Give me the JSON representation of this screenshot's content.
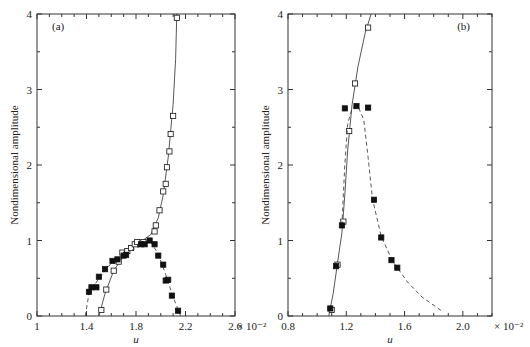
{
  "chart_data": [
    {
      "type": "scatter",
      "panel_label": "(a)",
      "xlabel": "u",
      "ylabel": "Nondimensional amplitude",
      "x_multiplier": "× 10⁻²",
      "xlim": [
        1.0,
        2.6
      ],
      "ylim": [
        0,
        4
      ],
      "xticks": [
        "1",
        "1.4",
        "1.8",
        "2.2",
        "2.6"
      ],
      "yticks": [
        "0",
        "1",
        "2",
        "3",
        "4"
      ],
      "series": [
        {
          "name": "open squares (solid fit)",
          "marker": "open-square",
          "line": "solid",
          "points": [
            [
              1.52,
              0.08
            ],
            [
              1.56,
              0.35
            ],
            [
              1.62,
              0.6
            ],
            [
              1.66,
              0.72
            ],
            [
              1.69,
              0.84
            ],
            [
              1.73,
              0.86
            ],
            [
              1.76,
              0.9
            ],
            [
              1.79,
              0.95
            ],
            [
              1.81,
              0.98
            ],
            [
              1.86,
              0.98
            ],
            [
              1.95,
              1.12
            ],
            [
              1.96,
              1.2
            ],
            [
              1.99,
              1.4
            ],
            [
              2.02,
              1.65
            ],
            [
              2.04,
              1.75
            ],
            [
              2.05,
              1.97
            ],
            [
              2.07,
              2.18
            ],
            [
              2.08,
              2.41
            ],
            [
              2.1,
              2.65
            ],
            [
              2.13,
              3.95
            ]
          ],
          "fit": [
            [
              1.5,
              0
            ],
            [
              1.55,
              0.3
            ],
            [
              1.62,
              0.6
            ],
            [
              1.72,
              0.84
            ],
            [
              1.82,
              0.96
            ],
            [
              1.92,
              1.08
            ],
            [
              1.98,
              1.3
            ],
            [
              2.02,
              1.6
            ],
            [
              2.06,
              2.1
            ],
            [
              2.1,
              2.8
            ],
            [
              2.12,
              3.4
            ],
            [
              2.13,
              4.0
            ]
          ]
        },
        {
          "name": "filled squares (dashed fit)",
          "marker": "filled-square",
          "line": "dashed",
          "points": [
            [
              1.42,
              0.32
            ],
            [
              1.44,
              0.38
            ],
            [
              1.48,
              0.38
            ],
            [
              1.5,
              0.52
            ],
            [
              1.55,
              0.62
            ],
            [
              1.61,
              0.73
            ],
            [
              1.65,
              0.75
            ],
            [
              1.7,
              0.8
            ],
            [
              1.72,
              0.81
            ],
            [
              1.84,
              0.95
            ],
            [
              1.87,
              0.95
            ],
            [
              1.91,
              1.0
            ],
            [
              1.95,
              0.95
            ],
            [
              1.98,
              0.8
            ],
            [
              2.02,
              0.68
            ],
            [
              2.04,
              0.47
            ],
            [
              2.06,
              0.48
            ],
            [
              2.09,
              0.27
            ],
            [
              2.14,
              0.07
            ]
          ],
          "fit": [
            [
              1.39,
              0
            ],
            [
              1.42,
              0.3
            ],
            [
              1.5,
              0.5
            ],
            [
              1.6,
              0.7
            ],
            [
              1.72,
              0.83
            ],
            [
              1.85,
              0.94
            ],
            [
              1.92,
              0.98
            ],
            [
              1.98,
              0.82
            ],
            [
              2.04,
              0.55
            ],
            [
              2.1,
              0.25
            ],
            [
              2.16,
              0
            ]
          ]
        }
      ]
    },
    {
      "type": "scatter",
      "panel_label": "(b)",
      "xlabel": "u",
      "ylabel": "Nondimensional amplitude",
      "x_multiplier": "× 10⁻²",
      "xlim": [
        0.8,
        2.2
      ],
      "ylim": [
        0,
        4
      ],
      "xticks": [
        "0.8",
        "1.2",
        "1.6",
        "2.0"
      ],
      "yticks": [
        "0",
        "1",
        "2",
        "3",
        "4"
      ],
      "series": [
        {
          "name": "open squares (solid fit)",
          "marker": "open-square",
          "line": "solid",
          "points": [
            [
              1.1,
              0.08
            ],
            [
              1.14,
              0.68
            ],
            [
              1.18,
              1.25
            ],
            [
              1.22,
              2.45
            ],
            [
              1.26,
              3.08
            ],
            [
              1.35,
              3.82
            ]
          ],
          "fit": [
            [
              1.08,
              0
            ],
            [
              1.11,
              0.3
            ],
            [
              1.14,
              0.7
            ],
            [
              1.17,
              1.1
            ],
            [
              1.19,
              1.6
            ],
            [
              1.21,
              2.2
            ],
            [
              1.24,
              2.8
            ],
            [
              1.28,
              3.3
            ],
            [
              1.33,
              3.75
            ],
            [
              1.37,
              4.0
            ]
          ]
        },
        {
          "name": "filled squares (dashed fit)",
          "marker": "filled-square",
          "line": "dashed",
          "points": [
            [
              1.09,
              0.1
            ],
            [
              1.13,
              0.66
            ],
            [
              1.17,
              1.2
            ],
            [
              1.19,
              2.75
            ],
            [
              1.27,
              2.78
            ],
            [
              1.35,
              2.76
            ],
            [
              1.39,
              1.54
            ],
            [
              1.44,
              1.04
            ],
            [
              1.51,
              0.74
            ],
            [
              1.55,
              0.64
            ]
          ],
          "fit": [
            [
              1.17,
              1.2
            ],
            [
              1.19,
              2.0
            ],
            [
              1.21,
              2.55
            ],
            [
              1.24,
              2.75
            ],
            [
              1.28,
              2.78
            ],
            [
              1.32,
              2.6
            ],
            [
              1.35,
              2.1
            ],
            [
              1.38,
              1.55
            ],
            [
              1.44,
              1.05
            ],
            [
              1.52,
              0.72
            ],
            [
              1.62,
              0.45
            ],
            [
              1.72,
              0.25
            ],
            [
              1.86,
              0.06
            ]
          ]
        }
      ]
    }
  ]
}
